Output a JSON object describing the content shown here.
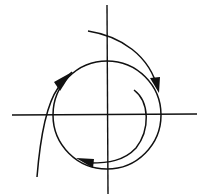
{
  "diagram": {
    "type": "phase-portrait",
    "colors": {
      "background": "#ffffff",
      "stroke": "#111111"
    },
    "axes": {
      "horizontal": {
        "x1": 12,
        "y1": 115,
        "x2": 197,
        "y2": 114
      },
      "vertical": {
        "x1": 107,
        "y1": 5,
        "x2": 108,
        "y2": 194
      }
    },
    "limit_cycle": {
      "cx": 107,
      "cy": 115,
      "r": 54
    },
    "trajectories": [
      {
        "id": "outer-top",
        "arrow_direction": "down"
      },
      {
        "id": "inner-spiral",
        "arrow_direction": "left"
      },
      {
        "id": "outer-left",
        "arrow_direction": "up-right"
      }
    ]
  }
}
